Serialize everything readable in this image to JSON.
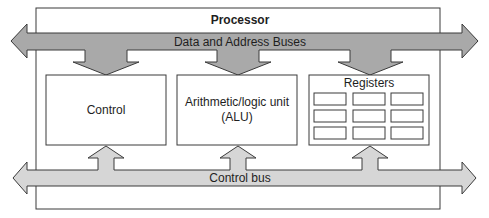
{
  "diagram": {
    "title": "Processor",
    "buses": {
      "data_address": {
        "label": "Data and Address Buses",
        "color": "#a9a9a9"
      },
      "control": {
        "label": "Control bus",
        "color": "#d6d6d6"
      }
    },
    "units": {
      "control": {
        "label": "Control"
      },
      "alu": {
        "line1": "Arithmetic/logic unit",
        "line2": "(ALU)"
      },
      "registers": {
        "label": "Registers",
        "rows": 3,
        "cols": 3
      }
    },
    "colors": {
      "outline": "#3a3a3a",
      "background": "#ffffff",
      "text": "#1e1e1e"
    }
  }
}
